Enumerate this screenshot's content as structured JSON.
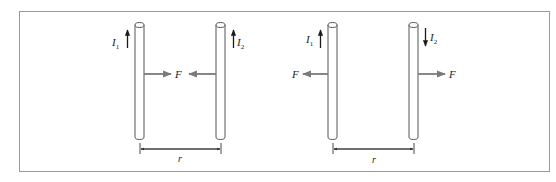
{
  "figure": {
    "frame_color": "#9a9a9a",
    "rod_stroke": "#555555",
    "current_arrow_color": "#1a1a1a",
    "force_arrow_color": "#7a7a7a",
    "panels": [
      {
        "id": "parallel-currents",
        "rods": [
          {
            "label_main": "I",
            "label_sub": "1",
            "current_direction": "up"
          },
          {
            "label_main": "I",
            "label_sub": "2",
            "current_direction": "up"
          }
        ],
        "force_label_left": "F",
        "force_description": "attractive",
        "distance_label": "r"
      },
      {
        "id": "antiparallel-currents",
        "rods": [
          {
            "label_main": "I",
            "label_sub": "1",
            "current_direction": "up"
          },
          {
            "label_main": "I",
            "label_sub": "2",
            "current_direction": "down"
          }
        ],
        "force_label_left": "F",
        "force_label_right": "F",
        "force_description": "repulsive",
        "distance_label": "r"
      }
    ]
  }
}
